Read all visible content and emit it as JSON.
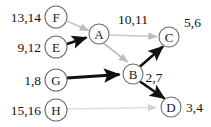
{
  "diagram": {
    "type": "directed-graph",
    "width": 211,
    "height": 127,
    "colors": {
      "background": "#ffffff",
      "node_stroke": "#6e6e6e",
      "node_fill": "#ffffff",
      "text": "#141414",
      "tree_edge": "#111111",
      "cross_edge": "#bcbcbc",
      "faint_edge": "#d8d8d8"
    },
    "nodes": [
      {
        "id": "F",
        "label": "F",
        "cx": 56,
        "cy": 17,
        "r": 11,
        "time_label": "13,14",
        "time_side": "left",
        "time_x": 41,
        "time_y": 17
      },
      {
        "id": "E",
        "label": "E",
        "cx": 56,
        "cy": 47,
        "r": 11,
        "time_label": "9,12",
        "time_side": "left",
        "time_x": 41,
        "time_y": 47
      },
      {
        "id": "G",
        "label": "G",
        "cx": 56,
        "cy": 80,
        "r": 11,
        "time_label": "1,8",
        "time_side": "left",
        "time_x": 41,
        "time_y": 80
      },
      {
        "id": "H",
        "label": "H",
        "cx": 56,
        "cy": 110,
        "r": 11,
        "time_label": "15,16",
        "time_side": "left",
        "time_x": 41,
        "time_y": 110
      },
      {
        "id": "A",
        "label": "A",
        "cx": 99,
        "cy": 34,
        "r": 10,
        "time_label": "",
        "time_side": "none",
        "time_x": 0,
        "time_y": 0
      },
      {
        "id": "B",
        "label": "B",
        "cx": 133,
        "cy": 74,
        "r": 10,
        "time_label": "",
        "time_side": "none",
        "time_x": 0,
        "time_y": 0
      },
      {
        "id": "C",
        "label": "C",
        "cx": 169,
        "cy": 37,
        "r": 10,
        "time_label": "5,6",
        "time_side": "right",
        "time_x": 184,
        "time_y": 22
      },
      {
        "id": "D",
        "label": "D",
        "cx": 171,
        "cy": 107,
        "r": 10,
        "time_label": "3,4",
        "time_side": "right",
        "time_x": 186,
        "time_y": 107
      }
    ],
    "edges": [
      {
        "from": "F",
        "to": "A",
        "kind": "cross",
        "color": "#c6c6c6",
        "width": 1.6,
        "arrow": "small"
      },
      {
        "from": "E",
        "to": "A",
        "kind": "tree",
        "color": "#111111",
        "width": 2.6,
        "arrow": "large"
      },
      {
        "from": "A",
        "to": "C",
        "kind": "cross",
        "color": "#c6c6c6",
        "width": 1.6,
        "arrow": "small"
      },
      {
        "from": "A",
        "to": "B",
        "kind": "cross",
        "color": "#bdbdbd",
        "width": 1.6,
        "arrow": "small"
      },
      {
        "from": "G",
        "to": "B",
        "kind": "tree",
        "color": "#111111",
        "width": 2.8,
        "arrow": "large"
      },
      {
        "from": "B",
        "to": "C",
        "kind": "tree",
        "color": "#111111",
        "width": 2.6,
        "arrow": "large"
      },
      {
        "from": "B",
        "to": "D",
        "kind": "tree",
        "color": "#111111",
        "width": 2.6,
        "arrow": "large"
      },
      {
        "from": "H",
        "to": "D",
        "kind": "faint",
        "color": "#dcdcdc",
        "width": 1.5,
        "arrow": "small"
      }
    ],
    "edge_labels": [
      {
        "id": "A-C",
        "text": "10,11",
        "x": 133,
        "y": 19
      },
      {
        "id": "B-C",
        "text": "2,7",
        "x": 154,
        "y": 77
      }
    ]
  }
}
